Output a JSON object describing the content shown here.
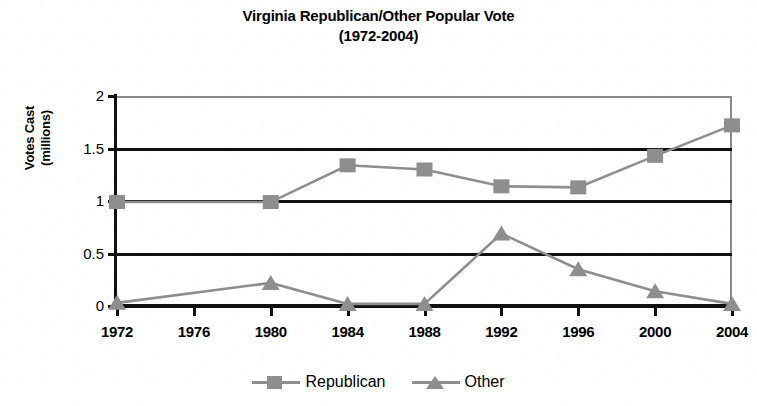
{
  "chart_data": {
    "type": "line",
    "title": "Virginia Republican/Other Popular Vote",
    "subtitle": "(1972-2004)",
    "xlabel": "",
    "ylabel": "Votes Cast (millions)",
    "ylabel_line1": "Votes Cast",
    "ylabel_line2": "(millions)",
    "categories": [
      "1972",
      "1976",
      "1980",
      "1984",
      "1988",
      "1992",
      "1996",
      "2000",
      "2004"
    ],
    "x": [
      1972,
      1976,
      1980,
      1984,
      1988,
      1992,
      1996,
      2000,
      2004
    ],
    "ylim": [
      0,
      2
    ],
    "yticks": [
      "0",
      "0.5",
      "1",
      "1.5",
      "2"
    ],
    "ytick_values": [
      0,
      0.5,
      1,
      1.5,
      2
    ],
    "grid": true,
    "legend_position": "bottom",
    "series": [
      {
        "name": "Republican",
        "marker": "square",
        "color": "#8e8e8e",
        "values": [
          0.99,
          null,
          0.99,
          1.34,
          1.3,
          1.14,
          1.13,
          1.43,
          1.72
        ]
      },
      {
        "name": "Other",
        "marker": "triangle",
        "color": "#8e8e8e",
        "values": [
          0.03,
          null,
          0.22,
          0.02,
          0.02,
          0.69,
          0.35,
          0.14,
          0.02
        ]
      }
    ],
    "note": "No data markers plotted at 1976; series lines span 1972 to 1980 directly."
  },
  "legend": {
    "entries": [
      {
        "label": "Republican",
        "marker": "square"
      },
      {
        "label": "Other",
        "marker": "triangle"
      }
    ]
  },
  "colors": {
    "series": "#8e8e8e",
    "axis": "#101010",
    "background": "#ffffff"
  }
}
